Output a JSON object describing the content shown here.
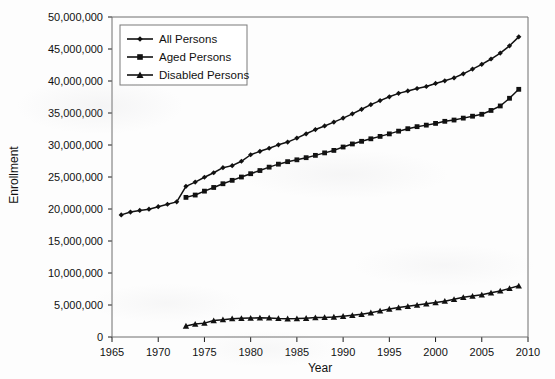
{
  "chart_data": {
    "type": "line",
    "title": "",
    "xlabel": "Year",
    "ylabel": "Enrollment",
    "xlim": [
      1965,
      2010
    ],
    "ylim": [
      0,
      50000000
    ],
    "xticks": [
      1965,
      1970,
      1975,
      1980,
      1985,
      1990,
      1995,
      2000,
      2005,
      2010
    ],
    "xtick_labels": [
      "1965",
      "1970",
      "1975",
      "1980",
      "1985",
      "1990",
      "1995",
      "2000",
      "2005",
      "2010"
    ],
    "yticks": [
      0,
      5000000,
      10000000,
      15000000,
      20000000,
      25000000,
      30000000,
      35000000,
      40000000,
      45000000,
      50000000
    ],
    "ytick_labels": [
      "0",
      "5,000,000",
      "10,000,000",
      "15,000,000",
      "20,000,000",
      "25,000,000",
      "30,000,000",
      "35,000,000",
      "40,000,000",
      "45,000,000",
      "50,000,000"
    ],
    "grid": false,
    "legend_position": "upper-left-inside",
    "line_color": "#111111",
    "series": [
      {
        "name": "All Persons",
        "marker": "diamond",
        "x": [
          1966,
          1967,
          1968,
          1969,
          1970,
          1971,
          1972,
          1973,
          1974,
          1975,
          1976,
          1977,
          1978,
          1979,
          1980,
          1981,
          1982,
          1983,
          1984,
          1985,
          1986,
          1987,
          1988,
          1989,
          1990,
          1991,
          1992,
          1993,
          1994,
          1995,
          1996,
          1997,
          1998,
          1999,
          2000,
          2001,
          2002,
          2003,
          2004,
          2005,
          2006,
          2007,
          2008,
          2009
        ],
        "values": [
          19082000,
          19521000,
          19771000,
          19972000,
          20361000,
          20742000,
          21115000,
          23545000,
          24201000,
          24959000,
          25663000,
          26458000,
          26777000,
          27459000,
          28478000,
          29010000,
          29494000,
          30026000,
          30455000,
          31083000,
          31750000,
          32411000,
          32980000,
          33579000,
          34203000,
          34870000,
          35579000,
          36306000,
          36935000,
          37535000,
          38070000,
          38445000,
          38825000,
          39140000,
          39617000,
          40026000,
          40488000,
          41126000,
          41862000,
          42604000,
          43436000,
          44368000,
          45500000,
          46900000
        ]
      },
      {
        "name": "Aged Persons",
        "marker": "square",
        "x": [
          1973,
          1974,
          1975,
          1976,
          1977,
          1978,
          1979,
          1980,
          1981,
          1982,
          1983,
          1984,
          1985,
          1986,
          1987,
          1988,
          1989,
          1990,
          1991,
          1992,
          1993,
          1994,
          1995,
          1996,
          1997,
          1998,
          1999,
          2000,
          2001,
          2002,
          2003,
          2004,
          2005,
          2006,
          2007,
          2008,
          2009
        ],
        "values": [
          21815000,
          22181000,
          22790000,
          23364000,
          23946000,
          24479000,
          24997000,
          25515000,
          26010000,
          26539000,
          27007000,
          27398000,
          27686000,
          28019000,
          28381000,
          28768000,
          29155000,
          29685000,
          30162000,
          30576000,
          30969000,
          31345000,
          31738000,
          32164000,
          32548000,
          32867000,
          33104000,
          33376000,
          33700000,
          33900000,
          34200000,
          34500000,
          34800000,
          35400000,
          36100000,
          37300000,
          38700000
        ]
      },
      {
        "name": "Disabled Persons",
        "marker": "triangle",
        "x": [
          1973,
          1974,
          1975,
          1976,
          1977,
          1978,
          1979,
          1980,
          1981,
          1982,
          1983,
          1984,
          1985,
          1986,
          1987,
          1988,
          1989,
          1990,
          1991,
          1992,
          1993,
          1994,
          1995,
          1996,
          1997,
          1998,
          1999,
          2000,
          2001,
          2002,
          2003,
          2004,
          2005,
          2006,
          2007,
          2008,
          2009
        ],
        "values": [
          1730000,
          2016000,
          2168000,
          2572000,
          2710000,
          2864000,
          2911000,
          2963000,
          2994000,
          2988000,
          2905000,
          2858000,
          2874000,
          2938000,
          3030000,
          3065000,
          3130000,
          3251000,
          3389000,
          3553000,
          3800000,
          4080000,
          4380000,
          4600000,
          4800000,
          5000000,
          5200000,
          5380000,
          5600000,
          5900000,
          6200000,
          6400000,
          6600000,
          6900000,
          7200000,
          7600000,
          8000000
        ]
      }
    ]
  },
  "axes": {
    "y_title": "Enrollment",
    "x_title": "Year"
  },
  "legend": {
    "items": [
      {
        "label": "All Persons",
        "marker": "diamond-marker"
      },
      {
        "label": "Aged Persons",
        "marker": "square-marker"
      },
      {
        "label": "Disabled Persons",
        "marker": "triangle-marker"
      }
    ]
  }
}
